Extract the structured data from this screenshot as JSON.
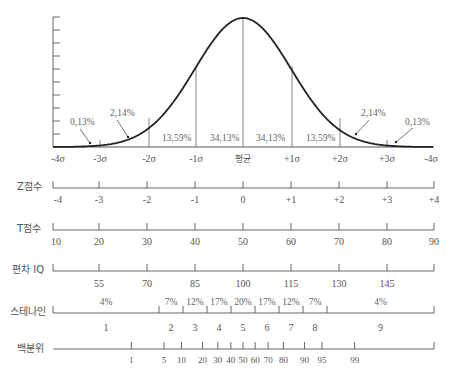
{
  "chart_data": {
    "type": "diagram",
    "title": "",
    "curve": {
      "name": "normal-distribution",
      "sigma_labels": [
        "-4σ",
        "-3σ",
        "-2σ",
        "-1σ",
        "평균",
        "+1σ",
        "+2σ",
        "+3σ",
        "-4σ"
      ],
      "area_labels": [
        {
          "text": "0,13%",
          "region": "below -3σ"
        },
        {
          "text": "2,14%",
          "region": "-3σ to -2σ"
        },
        {
          "text": "13,59%",
          "region": "-2σ to -1σ"
        },
        {
          "text": "34,13%",
          "region": "-1σ to mean"
        },
        {
          "text": "34,13%",
          "region": "mean to +1σ"
        },
        {
          "text": "13,59%",
          "region": "+1σ to +2σ"
        },
        {
          "text": "2,14%",
          "region": "+2σ to +3σ"
        },
        {
          "text": "0,13%",
          "region": "above +3σ"
        }
      ]
    },
    "scales": [
      {
        "label": "Z점수",
        "ticks": [
          "-4",
          "-3",
          "-2",
          "-1",
          "0",
          "+1",
          "+2",
          "+3",
          "+4"
        ]
      },
      {
        "label": "T점수",
        "ticks": [
          "10",
          "20",
          "30",
          "40",
          "50",
          "60",
          "70",
          "80",
          "90"
        ]
      },
      {
        "label": "편차 IQ",
        "ticks": [
          "55",
          "70",
          "85",
          "100",
          "115",
          "130",
          "145"
        ]
      },
      {
        "label": "스테나인",
        "percents": [
          "4%",
          "7%",
          "12%",
          "17%",
          "20%",
          "17%",
          "12%",
          "7%",
          "4%"
        ],
        "values": [
          "1",
          "2",
          "3",
          "4",
          "5",
          "6",
          "7",
          "8",
          "9"
        ]
      },
      {
        "label": "백분위",
        "ticks": [
          "1",
          "5",
          "10",
          "20",
          "30",
          "40",
          "50",
          "60",
          "70",
          "80",
          "90",
          "95",
          "99"
        ]
      }
    ]
  },
  "labels": {
    "z": "Z점수",
    "t": "T점수",
    "iq": "편차 IQ",
    "stanine": "스테나인",
    "percentile": "백분위",
    "mean": "평균"
  },
  "sigma": [
    "-4σ",
    "-3σ",
    "-2σ",
    "-1σ",
    "평균",
    "+1σ",
    "+2σ",
    "+3σ",
    "-4σ"
  ],
  "areas": [
    "0,13%",
    "2,14%",
    "13,59%",
    "34,13%",
    "34,13%",
    "13,59%",
    "2,14%",
    "0,13%"
  ],
  "z_ticks": [
    "-4",
    "-3",
    "-2",
    "-1",
    "0",
    "+1",
    "+2",
    "+3",
    "+4"
  ],
  "t_ticks": [
    "10",
    "20",
    "30",
    "40",
    "50",
    "60",
    "70",
    "80",
    "90"
  ],
  "iq_ticks": [
    "55",
    "70",
    "85",
    "100",
    "115",
    "130",
    "145"
  ],
  "stanine_pcts": [
    "4%",
    "7%",
    "12%",
    "17%",
    "20%",
    "17%",
    "12%",
    "7%",
    "4%"
  ],
  "stanine_vals": [
    "1",
    "2",
    "3",
    "4",
    "5",
    "6",
    "7",
    "8",
    "9"
  ],
  "pct_ticks": [
    "1",
    "5",
    "10",
    "20",
    "30",
    "40",
    "50",
    "60",
    "70",
    "80",
    "90",
    "95",
    "99"
  ],
  "colors": {
    "line": "#333333",
    "axis": "#666666",
    "text": "#555555"
  }
}
